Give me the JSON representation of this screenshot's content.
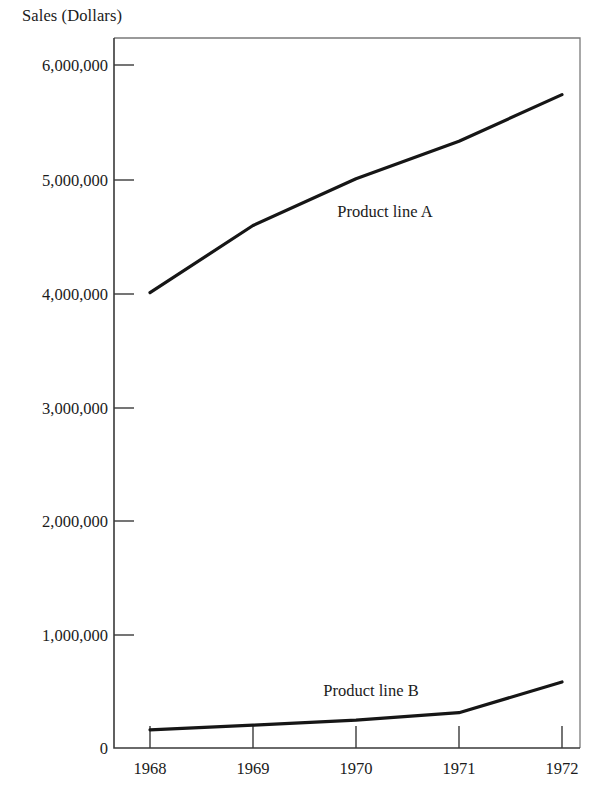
{
  "chart_data": {
    "type": "line",
    "title": "",
    "ylabel": "Sales (Dollars)",
    "xlabel": "",
    "categories": [
      "1968",
      "1969",
      "1970",
      "1971",
      "1972"
    ],
    "x": [
      1968,
      1969,
      1970,
      1971,
      1972
    ],
    "xlim": [
      1968,
      1972
    ],
    "ylim": [
      0,
      6000000
    ],
    "grid": false,
    "legend_position": "inline-labels",
    "ytick_labels": [
      "6,000,000",
      "5,000,000",
      "4,000,000",
      "3,000,000",
      "2,000,000",
      "1,000,000",
      "0"
    ],
    "ytick_values": [
      6000000,
      5000000,
      4000000,
      3000000,
      2000000,
      1000000,
      0
    ],
    "series": [
      {
        "name": "Product line A",
        "label": "Product line A",
        "color": "#161616",
        "values": [
          4000000,
          4590000,
          5000000,
          5330000,
          5740000
        ]
      },
      {
        "name": "Product line B",
        "label": "Product line B",
        "color": "#161616",
        "values": [
          160000,
          200000,
          245000,
          310000,
          580000
        ]
      }
    ],
    "annotations": [
      {
        "text": "Product line A",
        "x": 1970.0,
        "y": 4280000
      },
      {
        "text": "Product line B",
        "x": 1969.55,
        "y": 640000
      }
    ]
  }
}
